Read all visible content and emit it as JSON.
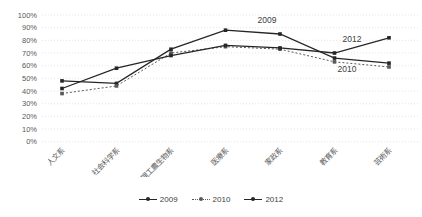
{
  "chart_data": {
    "type": "line",
    "categories": [
      "人文系",
      "社会科学系",
      "理工農生物系",
      "医療系",
      "家政系",
      "教育系",
      "芸術系"
    ],
    "series": [
      {
        "name": "2009",
        "style": "solid",
        "color": "#262626",
        "values": [
          48,
          46,
          73,
          88,
          85,
          66,
          62
        ]
      },
      {
        "name": "2010",
        "style": "dotted",
        "color": "#595959",
        "values": [
          38,
          44,
          70,
          75,
          73,
          63,
          59
        ]
      },
      {
        "name": "2012",
        "style": "solid",
        "color": "#262626",
        "values": [
          42,
          58,
          68,
          76,
          74,
          70,
          82
        ]
      }
    ],
    "title": "",
    "xlabel": "",
    "ylabel": "",
    "ylim": [
      0,
      100
    ],
    "ytick_step": 10,
    "ytick_labels": [
      "0%",
      "10%",
      "20%",
      "30%",
      "40%",
      "50%",
      "60%",
      "70%",
      "80%",
      "90%",
      "100%"
    ],
    "grid": true,
    "legend_position": "bottom",
    "annotations": [
      {
        "text": "2009",
        "x": 267,
        "y": 23
      },
      {
        "text": "2012",
        "x": 352,
        "y": 42
      },
      {
        "text": "2010",
        "x": 347,
        "y": 72
      }
    ],
    "colors": {
      "grid": "#d9d9d9",
      "axis_text": "#595959",
      "annotation_text": "#404040"
    }
  }
}
